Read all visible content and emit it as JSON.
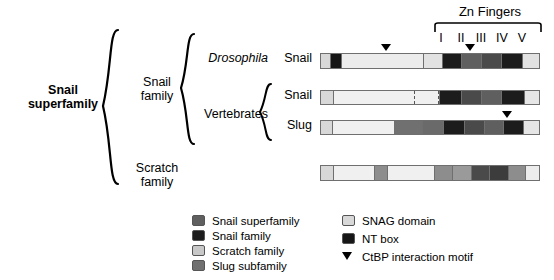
{
  "figure": {
    "title_text": "Snail superfamily domain architecture"
  },
  "hierarchy": {
    "root_label": "Snail\nsuperfamily",
    "level2": [
      {
        "label": "Snail\nfamily"
      },
      {
        "label": "Scratch\nfamily"
      }
    ],
    "level3": [
      {
        "label": "Drosophila",
        "italic": true
      },
      {
        "label": "Vertebrates",
        "italic": false
      }
    ],
    "level4": [
      {
        "label": "Snail"
      },
      {
        "label": "Snail"
      },
      {
        "label": "Slug"
      }
    ]
  },
  "zn_fingers": {
    "header": "Zn Fingers",
    "numerals": [
      "I",
      "II",
      "III",
      "IV",
      "V"
    ]
  },
  "colors": {
    "snail_superfamily": "#5f5f5f",
    "snail_family": "#1c1c1c",
    "scratch_family": "#c8c8c8",
    "slug_subfamily": "#707070",
    "snag_domain": "#d8d8d8",
    "nt_box": "#161616",
    "backbone": "#ececec",
    "outline": "#6f6f6f",
    "ctbp_motif": "#000000"
  },
  "proteins": [
    {
      "name": "drosophila-snail",
      "row_label": "Snail",
      "segments": [
        {
          "name": "snag-domain",
          "width": 9,
          "fill": "#d8d8d8"
        },
        {
          "name": "nt-box",
          "width": 11,
          "fill": "#161616"
        },
        {
          "name": "linker",
          "width": 84,
          "fill": "#ececec"
        },
        {
          "name": "zn-finger-I",
          "width": 18,
          "fill": "#e2e2e2"
        },
        {
          "name": "zn-finger-II",
          "width": 19,
          "fill": "#1c1c1c"
        },
        {
          "name": "zn-finger-III",
          "width": 20,
          "fill": "#5f5f5f"
        },
        {
          "name": "zn-finger-IV",
          "width": 20,
          "fill": "#4a4a4a"
        },
        {
          "name": "zn-finger-V",
          "width": 20,
          "fill": "#1c1c1c"
        },
        {
          "name": "c-terminus",
          "width": 17,
          "fill": "#e2e2e2"
        }
      ],
      "ctbp_motifs": [
        30,
        68
      ]
    },
    {
      "name": "vertebrate-snail",
      "row_label": "Snail",
      "segments": [
        {
          "name": "snag-domain",
          "width": 12,
          "fill": "#d8d8d8"
        },
        {
          "name": "linker",
          "width": 84,
          "fill": "#f0f0f0"
        },
        {
          "name": "zn-finger-I-degenerate",
          "width": 23,
          "fill": "#f0f0f0",
          "dashed": true
        },
        {
          "name": "zn-finger-II",
          "width": 22,
          "fill": "#1c1c1c"
        },
        {
          "name": "zn-finger-III",
          "width": 20,
          "fill": "#4a4a4a"
        },
        {
          "name": "zn-finger-IV",
          "width": 20,
          "fill": "#5f5f5f"
        },
        {
          "name": "zn-finger-V",
          "width": 22,
          "fill": "#1c1c1c"
        },
        {
          "name": "c-terminus",
          "width": 15,
          "fill": "#e6e6e6"
        }
      ],
      "ctbp_motifs": []
    },
    {
      "name": "vertebrate-slug",
      "row_label": "Slug",
      "segments": [
        {
          "name": "snag-domain",
          "width": 12,
          "fill": "#d8d8d8"
        },
        {
          "name": "linker",
          "width": 66,
          "fill": "#f0f0f0"
        },
        {
          "name": "slug-subfamily-domain",
          "width": 28,
          "fill": "#707070"
        },
        {
          "name": "zn-finger-I",
          "width": 22,
          "fill": "#6a6a6a"
        },
        {
          "name": "zn-finger-II",
          "width": 22,
          "fill": "#1c1c1c"
        },
        {
          "name": "zn-finger-III",
          "width": 20,
          "fill": "#4a4a4a"
        },
        {
          "name": "zn-finger-IV",
          "width": 19,
          "fill": "#5f5f5f"
        },
        {
          "name": "zn-finger-V",
          "width": 21,
          "fill": "#1c1c1c"
        },
        {
          "name": "c-terminus",
          "width": 16,
          "fill": "#e6e6e6"
        }
      ],
      "ctbp_motifs": [
        85
      ]
    },
    {
      "name": "scratch",
      "row_label": "",
      "segments": [
        {
          "name": "snag-domain",
          "width": 14,
          "fill": "#d8d8d8"
        },
        {
          "name": "linker-a",
          "width": 48,
          "fill": "#f0f0f0"
        },
        {
          "name": "scratch-domain",
          "width": 14,
          "fill": "#8d8d8d"
        },
        {
          "name": "linker-b",
          "width": 55,
          "fill": "#f0f0f0"
        },
        {
          "name": "zn-finger-I",
          "width": 21,
          "fill": "#8d8d8d"
        },
        {
          "name": "zn-finger-II",
          "width": 21,
          "fill": "#9a9a9a"
        },
        {
          "name": "zn-finger-III",
          "width": 21,
          "fill": "#4a4a4a"
        },
        {
          "name": "zn-finger-IV",
          "width": 21,
          "fill": "#3c3c3c"
        },
        {
          "name": "zn-finger-V",
          "width": 19,
          "fill": "#8d8d8d"
        },
        {
          "name": "c-terminus",
          "width": 16,
          "fill": "#ececec"
        }
      ],
      "ctbp_motifs": []
    }
  ],
  "legend_left": [
    {
      "label": "Snail superfamily",
      "swatch": "#5f5f5f",
      "shape": "box"
    },
    {
      "label": "Snail family",
      "swatch": "#1c1c1c",
      "shape": "box"
    },
    {
      "label": "Scratch family",
      "swatch": "#c8c8c8",
      "shape": "box"
    },
    {
      "label": "Slug subfamily",
      "swatch": "#707070",
      "shape": "box"
    }
  ],
  "legend_right": [
    {
      "label": "SNAG domain",
      "swatch": "#d8d8d8",
      "shape": "box"
    },
    {
      "label": "NT box",
      "swatch": "#161616",
      "shape": "box"
    },
    {
      "label": "CtBP interaction motif",
      "swatch": "#000000",
      "shape": "triangle"
    }
  ]
}
